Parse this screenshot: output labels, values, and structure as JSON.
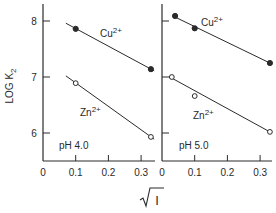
{
  "chart_data": [
    {
      "type": "scatter",
      "panel_label": "pH 4.0",
      "ylabel": "LOG K2",
      "xlabel": "√I",
      "xlim": [
        0,
        0.35
      ],
      "ylim": [
        5.5,
        8.3
      ],
      "xticks": [
        0,
        0.1,
        0.2,
        0.3
      ],
      "xtick_labels": [
        "0",
        "0.1",
        "0.2",
        "0.3"
      ],
      "yticks": [
        6,
        7,
        8
      ],
      "ytick_labels": [
        "6",
        "7",
        "8"
      ],
      "grid": false,
      "series": [
        {
          "name": "Cu2+",
          "marker": "filled-circle",
          "points": [
            [
              0.1,
              7.86
            ],
            [
              0.33,
              7.14
            ]
          ],
          "fit_line": [
            [
              0.07,
              7.96
            ],
            [
              0.34,
              7.11
            ]
          ]
        },
        {
          "name": "Zn2+",
          "marker": "open-circle",
          "points": [
            [
              0.1,
              6.89
            ],
            [
              0.33,
              5.93
            ]
          ],
          "fit_line": [
            [
              0.07,
              7.02
            ],
            [
              0.34,
              5.89
            ]
          ]
        }
      ]
    },
    {
      "type": "scatter",
      "panel_label": "pH 5.0",
      "ylabel": "LOG K2",
      "xlabel": "√I",
      "xlim": [
        0,
        0.33
      ],
      "ylim": [
        5.5,
        8.3
      ],
      "xticks": [
        0,
        0.1,
        0.2,
        0.3
      ],
      "xtick_labels": [
        "0",
        "0.1",
        "0.2",
        "0.3"
      ],
      "yticks": [
        6,
        7,
        8
      ],
      "ytick_labels": [
        "6",
        "7",
        "8"
      ],
      "grid": false,
      "series": [
        {
          "name": "Cu2+",
          "marker": "filled-circle",
          "points": [
            [
              0.04,
              8.09
            ],
            [
              0.1,
              7.87
            ],
            [
              0.33,
              7.25
            ]
          ],
          "fit_line": [
            [
              0.04,
              8.07
            ],
            [
              0.33,
              7.25
            ]
          ]
        },
        {
          "name": "Zn2+",
          "marker": "open-circle",
          "points": [
            [
              0.03,
              7.0
            ],
            [
              0.1,
              6.66
            ],
            [
              0.33,
              6.02
            ]
          ],
          "fit_line": [
            [
              0.03,
              6.98
            ],
            [
              0.33,
              6.02
            ]
          ]
        }
      ]
    }
  ],
  "labels": {
    "ylabel_main": "LOG K",
    "ylabel_sub": "2",
    "xlabel": "I",
    "cu_base": "Cu",
    "cu_sup": "2+",
    "zn_base": "Zn",
    "zn_sup": "2+",
    "ph_left": "pH 4.0",
    "ph_right": "pH 5.0"
  }
}
